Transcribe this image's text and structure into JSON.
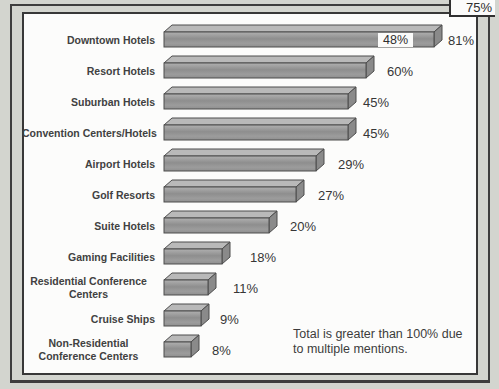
{
  "colors": {
    "page_bg": "#d3d5cf",
    "frame": "#3e3e3e",
    "chart_bg": "#fcfcfb",
    "bar_top": "#b9b9b9",
    "bar_side": "#8a8a8a",
    "bar_front_light": "#b0b0b0",
    "bar_front_dark": "#8e8e8e",
    "bar_stroke": "#4d4d4d",
    "text": "#3c3c3c"
  },
  "chart_data": {
    "type": "bar",
    "orientation": "horizontal",
    "title": "",
    "xlabel": "",
    "ylabel": "",
    "grid": false,
    "legend": "none",
    "categories": [
      "Downtown Hotels",
      "Resort Hotels",
      "Suburban Hotels",
      "Convention Centers/Hotels",
      "Airport Hotels",
      "Golf Resorts",
      "Suite Hotels",
      "Gaming Facilities",
      "Residential Conference Centers",
      "Cruise Ships",
      "Non-Residential Conference Centers"
    ],
    "values": [
      81,
      60,
      45,
      45,
      29,
      27,
      20,
      18,
      11,
      9,
      8
    ],
    "items": [
      {
        "label_lines": [
          "Downtown Hotels"
        ],
        "value": 81,
        "value_label": "81%",
        "inline_label": "48%"
      },
      {
        "label_lines": [
          "Resort Hotels"
        ],
        "value": 60,
        "value_label": "60%"
      },
      {
        "label_lines": [
          "Suburban Hotels"
        ],
        "value": 45,
        "value_label": "45%"
      },
      {
        "label_lines": [
          "Convention Centers/Hotels"
        ],
        "value": 45,
        "value_label": "45%"
      },
      {
        "label_lines": [
          "Airport Hotels"
        ],
        "value": 29,
        "value_label": "29%"
      },
      {
        "label_lines": [
          "Golf Resorts"
        ],
        "value": 27,
        "value_label": "27%"
      },
      {
        "label_lines": [
          "Suite Hotels"
        ],
        "value": 20,
        "value_label": "20%"
      },
      {
        "label_lines": [
          "Gaming Facilities"
        ],
        "value": 18,
        "value_label": "18%"
      },
      {
        "label_lines": [
          "Residential Conference",
          "Centers"
        ],
        "value": 11,
        "value_label": "11%"
      },
      {
        "label_lines": [
          "Cruise Ships"
        ],
        "value": 9,
        "value_label": "9%"
      },
      {
        "label_lines": [
          "Non-Residential",
          "Conference Centers"
        ],
        "value": 8,
        "value_label": "8%"
      }
    ],
    "annotations": {
      "top_right_label": "75%",
      "inside_first_bar_label": "48%",
      "note_line1": "Total is greater than 100% due",
      "note_line2": "to multiple mentions."
    },
    "layout": {
      "bar_front_px": [
        270,
        202,
        184,
        184,
        152,
        132,
        105,
        58,
        44,
        37,
        27
      ],
      "value_label_offset_px": [
        285,
        224,
        200,
        200,
        175,
        155,
        127,
        87,
        70,
        57,
        49
      ],
      "inline_label_offset_px": 215,
      "row_start_px": 12,
      "row_step_px": 31
    }
  }
}
